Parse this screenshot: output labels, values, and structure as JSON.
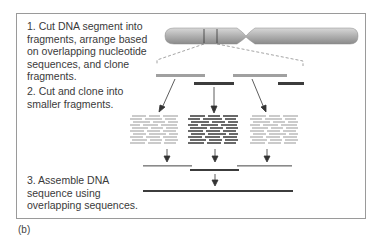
{
  "figure": {
    "caption": "(b)",
    "steps": [
      {
        "number": 1,
        "text": "1. Cut DNA segment into fragments, arrange based on overlapping nucleotide sequences, and clone fragments."
      },
      {
        "number": 2,
        "text": "2. Cut and clone into smaller fragments."
      },
      {
        "number": 3,
        "text": "3. Assemble DNA sequence using overlapping sequences."
      }
    ],
    "colors": {
      "light_fragment": "#a0a0a0",
      "dark_fragment": "#3c3c3c",
      "chromosome": "#b5b5b5",
      "border": "#9a9a9a"
    }
  }
}
